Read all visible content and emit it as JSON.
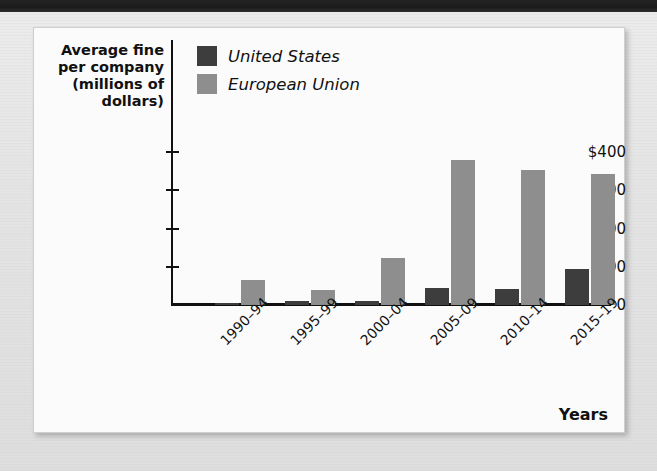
{
  "page": {
    "background_color": "#e8e8e8",
    "top_band_color": "#1f1f1f",
    "ghost_lines": [
      "as a result of the",
      "in the 1990s and",
      "increased sharply",
      "the average fine",
      "per company rose",
      "economists have argued that",
      "competition policy",
      "in both jurisdictions"
    ]
  },
  "panel": {
    "background_color": "#fbfbfb",
    "border_color": "#cfcfcf"
  },
  "chart_data": {
    "type": "bar",
    "title": "",
    "subtitle": "",
    "ylabel": "Average fine per company (millions of dollars)",
    "xlabel": "Years",
    "categories": [
      "1990–94",
      "1995–99",
      "2000–04",
      "2005–09",
      "2010–14",
      "2015–19"
    ],
    "series": [
      {
        "name": "United States",
        "color": "#3d3d3d",
        "values": [
          3,
          10,
          10,
          45,
          43,
          93
        ]
      },
      {
        "name": "European Union",
        "color": "#8e8e8e",
        "values": [
          65,
          38,
          122,
          380,
          352,
          342
        ]
      }
    ],
    "ylim": [
      0,
      400
    ],
    "yticks": [
      0,
      100,
      200,
      300,
      400
    ],
    "ytick_labels": [
      "0",
      "100",
      "200",
      "300",
      "$400"
    ],
    "grid": false,
    "legend_position": "top-left",
    "xtick_rotation": -45
  },
  "legend": {
    "items": [
      {
        "label": "United States",
        "swatch_color": "#3d3d3d"
      },
      {
        "label": "European Union",
        "swatch_color": "#8e8e8e"
      }
    ]
  }
}
